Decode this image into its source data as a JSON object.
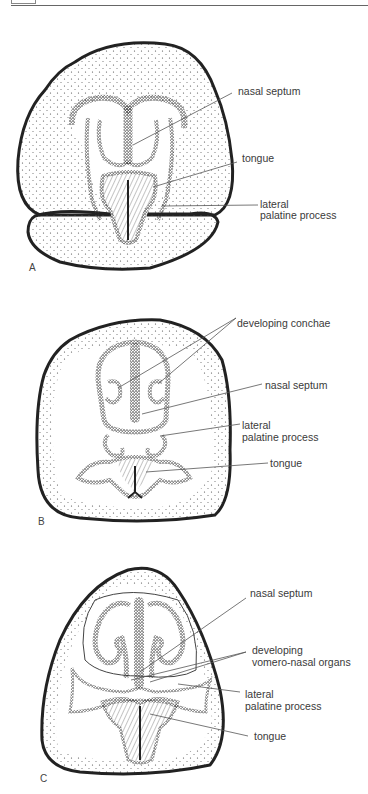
{
  "figure": {
    "panels": [
      {
        "letter": "A",
        "labels": {
          "nasal_septum": "nasal septum",
          "tongue": "tongue",
          "lateral_palatine_1": "lateral",
          "lateral_palatine_2": "palatine process"
        }
      },
      {
        "letter": "B",
        "labels": {
          "developing_conchae": "developing conchae",
          "nasal_septum": "nasal septum",
          "lateral_palatine_1": "lateral",
          "lateral_palatine_2": "palatine process",
          "tongue": "tongue"
        }
      },
      {
        "letter": "C",
        "labels": {
          "nasal_septum": "nasal septum",
          "vomero_1": "developing",
          "vomero_2": "vomero-nasal organs",
          "lateral_palatine_1": "lateral",
          "lateral_palatine_2": "palatine process",
          "tongue": "tongue"
        }
      }
    ],
    "colors": {
      "ink": "#222222",
      "leader": "#555555",
      "background": "#ffffff"
    }
  }
}
